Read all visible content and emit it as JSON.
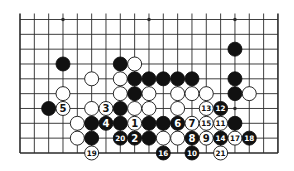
{
  "board": {
    "columns": 19,
    "rows": 10,
    "origin_x": 20,
    "origin_y": 19.5,
    "spacing_x": 14.33,
    "spacing_y": 14.83,
    "stone_radius": 7,
    "open_top_edge": true,
    "line_color": "#2a2a2a",
    "black_color": "#111111",
    "white_color": "#ffffff",
    "star_points": [
      [
        3,
        0
      ],
      [
        9,
        0
      ],
      [
        15,
        0
      ],
      [
        15,
        6
      ]
    ]
  },
  "stones": [
    {
      "c": 3,
      "r": 3,
      "color": "black"
    },
    {
      "c": 7,
      "r": 3,
      "color": "black"
    },
    {
      "c": 8,
      "r": 3,
      "color": "white"
    },
    {
      "c": 15,
      "r": 2,
      "color": "black"
    },
    {
      "c": 5,
      "r": 4,
      "color": "white"
    },
    {
      "c": 7,
      "r": 4,
      "color": "white"
    },
    {
      "c": 8,
      "r": 4,
      "color": "black"
    },
    {
      "c": 9,
      "r": 4,
      "color": "black"
    },
    {
      "c": 10,
      "r": 4,
      "color": "black"
    },
    {
      "c": 11,
      "r": 4,
      "color": "black"
    },
    {
      "c": 12,
      "r": 4,
      "color": "black"
    },
    {
      "c": 15,
      "r": 4,
      "color": "black"
    },
    {
      "c": 3,
      "r": 5,
      "color": "white"
    },
    {
      "c": 7,
      "r": 5,
      "color": "white"
    },
    {
      "c": 8,
      "r": 5,
      "color": "black"
    },
    {
      "c": 9,
      "r": 5,
      "color": "white"
    },
    {
      "c": 11,
      "r": 5,
      "color": "white"
    },
    {
      "c": 12,
      "r": 5,
      "color": "white"
    },
    {
      "c": 13,
      "r": 5,
      "color": "white"
    },
    {
      "c": 15,
      "r": 5,
      "color": "black"
    },
    {
      "c": 16,
      "r": 5,
      "color": "white"
    },
    {
      "c": 2,
      "r": 6,
      "color": "black"
    },
    {
      "c": 5,
      "r": 6,
      "color": "white"
    },
    {
      "c": 7,
      "r": 6,
      "color": "black"
    },
    {
      "c": 8,
      "r": 6,
      "color": "white"
    },
    {
      "c": 9,
      "r": 6,
      "color": "white"
    },
    {
      "c": 11,
      "r": 6,
      "color": "white"
    },
    {
      "c": 4,
      "r": 7,
      "color": "white"
    },
    {
      "c": 5,
      "r": 7,
      "color": "black"
    },
    {
      "c": 7,
      "r": 7,
      "color": "black"
    },
    {
      "c": 9,
      "r": 7,
      "color": "black"
    },
    {
      "c": 10,
      "r": 7,
      "color": "black"
    },
    {
      "c": 15,
      "r": 7,
      "color": "black"
    },
    {
      "c": 4,
      "r": 8,
      "color": "white"
    },
    {
      "c": 5,
      "r": 8,
      "color": "black"
    },
    {
      "c": 9,
      "r": 8,
      "color": "black"
    },
    {
      "c": 10,
      "r": 8,
      "color": "white"
    },
    {
      "c": 11,
      "r": 8,
      "color": "white"
    }
  ],
  "moves": [
    {
      "n": "1",
      "c": 8,
      "r": 7,
      "color": "white"
    },
    {
      "n": "2",
      "c": 8,
      "r": 8,
      "color": "black"
    },
    {
      "n": "3",
      "c": 6,
      "r": 6,
      "color": "white"
    },
    {
      "n": "4",
      "c": 6,
      "r": 7,
      "color": "black"
    },
    {
      "n": "5",
      "c": 3,
      "r": 6,
      "color": "white"
    },
    {
      "n": "6",
      "c": 11,
      "r": 7,
      "color": "black"
    },
    {
      "n": "7",
      "c": 12,
      "r": 7,
      "color": "white"
    },
    {
      "n": "8",
      "c": 12,
      "r": 8,
      "color": "black"
    },
    {
      "n": "9",
      "c": 13,
      "r": 8,
      "color": "white"
    },
    {
      "n": "10",
      "c": 12,
      "r": 9,
      "color": "black"
    },
    {
      "n": "11",
      "c": 14,
      "r": 7,
      "color": "white"
    },
    {
      "n": "12",
      "c": 14,
      "r": 6,
      "color": "black"
    },
    {
      "n": "13",
      "c": 13,
      "r": 6,
      "color": "white"
    },
    {
      "n": "14",
      "c": 14,
      "r": 8,
      "color": "black"
    },
    {
      "n": "15",
      "c": 13,
      "r": 7,
      "color": "white"
    },
    {
      "n": "16",
      "c": 10,
      "r": 9,
      "color": "black"
    },
    {
      "n": "17",
      "c": 15,
      "r": 8,
      "color": "white"
    },
    {
      "n": "18",
      "c": 16,
      "r": 8,
      "color": "black"
    },
    {
      "n": "19",
      "c": 5,
      "r": 9,
      "color": "white"
    },
    {
      "n": "20",
      "c": 7,
      "r": 8,
      "color": "black"
    },
    {
      "n": "21",
      "c": 14,
      "r": 9,
      "color": "white"
    }
  ]
}
